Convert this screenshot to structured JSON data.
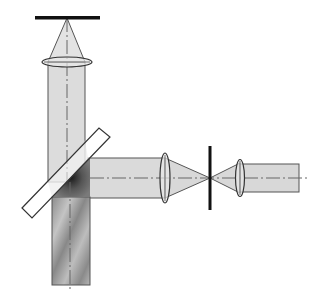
{
  "diagram": {
    "type": "optical-setup",
    "components": [
      {
        "name": "sample-plane",
        "kind": "bar"
      },
      {
        "name": "objective-lens",
        "kind": "lens"
      },
      {
        "name": "beamsplitter",
        "kind": "plate"
      },
      {
        "name": "focusing-lens",
        "kind": "lens"
      },
      {
        "name": "pinhole",
        "kind": "aperture"
      },
      {
        "name": "collimating-lens",
        "kind": "lens"
      }
    ],
    "colors": {
      "beam_light": "#dcdcdc",
      "beam_dark": "#8a8a8a",
      "stroke": "#444444",
      "bar": "#111111",
      "axis": "#666666"
    }
  }
}
